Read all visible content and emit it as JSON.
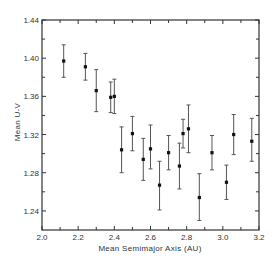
{
  "chart_data": {
    "type": "scatter",
    "title": "",
    "xlabel": "Mean Semimajor Axis (AU)",
    "ylabel": "Mean U-V",
    "xlim": [
      2.0,
      3.2
    ],
    "ylim": [
      1.22,
      1.44
    ],
    "xticks": [
      2.0,
      2.2,
      2.4,
      2.6,
      2.8,
      3.0,
      3.2
    ],
    "xtick_labels": [
      "2.0",
      "2.2",
      "2.4",
      "2.6",
      "2.8",
      "3.0",
      "3.2"
    ],
    "yticks": [
      1.24,
      1.28,
      1.32,
      1.36,
      1.4,
      1.44
    ],
    "ytick_labels": [
      "1.24",
      "1.28",
      "1.32",
      "1.36",
      "1.40",
      "1.44"
    ],
    "grid": false,
    "legend": null,
    "error_bars": true,
    "series": [
      {
        "name": "Mean U-V",
        "points": [
          {
            "x": 2.12,
            "y": 1.397,
            "err_low": 1.38,
            "err_high": 1.414
          },
          {
            "x": 2.24,
            "y": 1.391,
            "err_low": 1.377,
            "err_high": 1.405
          },
          {
            "x": 2.3,
            "y": 1.366,
            "err_low": 1.344,
            "err_high": 1.388
          },
          {
            "x": 2.38,
            "y": 1.359,
            "err_low": 1.343,
            "err_high": 1.375
          },
          {
            "x": 2.4,
            "y": 1.36,
            "err_low": 1.342,
            "err_high": 1.378
          },
          {
            "x": 2.44,
            "y": 1.304,
            "err_low": 1.28,
            "err_high": 1.328
          },
          {
            "x": 2.5,
            "y": 1.321,
            "err_low": 1.303,
            "err_high": 1.339
          },
          {
            "x": 2.56,
            "y": 1.294,
            "err_low": 1.272,
            "err_high": 1.316
          },
          {
            "x": 2.6,
            "y": 1.305,
            "err_low": 1.284,
            "err_high": 1.33
          },
          {
            "x": 2.65,
            "y": 1.267,
            "err_low": 1.241,
            "err_high": 1.292
          },
          {
            "x": 2.7,
            "y": 1.301,
            "err_low": 1.283,
            "err_high": 1.319
          },
          {
            "x": 2.76,
            "y": 1.287,
            "err_low": 1.263,
            "err_high": 1.311
          },
          {
            "x": 2.78,
            "y": 1.321,
            "err_low": 1.306,
            "err_high": 1.336
          },
          {
            "x": 2.81,
            "y": 1.326,
            "err_low": 1.301,
            "err_high": 1.351
          },
          {
            "x": 2.87,
            "y": 1.254,
            "err_low": 1.23,
            "err_high": 1.279
          },
          {
            "x": 2.94,
            "y": 1.301,
            "err_low": 1.283,
            "err_high": 1.319
          },
          {
            "x": 3.02,
            "y": 1.27,
            "err_low": 1.252,
            "err_high": 1.288
          },
          {
            "x": 3.06,
            "y": 1.32,
            "err_low": 1.299,
            "err_high": 1.341
          },
          {
            "x": 3.16,
            "y": 1.313,
            "err_low": 1.292,
            "err_high": 1.337
          }
        ]
      }
    ]
  },
  "style": {
    "axis_color": "#333333",
    "marker_color": "#111111",
    "errorbar_color": "#555555"
  }
}
